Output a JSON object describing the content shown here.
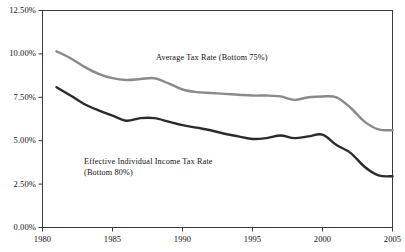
{
  "chart_data": {
    "type": "line",
    "title": "",
    "subtitle": "",
    "xlabel": "",
    "ylabel": "",
    "grid": false,
    "legend_position": "inline-annotation",
    "xlim": [
      1980,
      2005
    ],
    "ylim": [
      0.0,
      12.5
    ],
    "x_ticks": [
      "1980",
      "1985",
      "1990",
      "1995",
      "2000",
      "2005"
    ],
    "x_tick_values": [
      1980,
      1985,
      1990,
      1995,
      2000,
      2005
    ],
    "y_ticks": [
      "0.00%",
      "2.50%",
      "5.00%",
      "7.50%",
      "10.00%",
      "12.50%"
    ],
    "y_tick_values": [
      0.0,
      2.5,
      5.0,
      7.5,
      10.0,
      12.5
    ],
    "x": [
      1981,
      1982,
      1983,
      1984,
      1985,
      1986,
      1987,
      1988,
      1989,
      1990,
      1991,
      1992,
      1993,
      1994,
      1995,
      1996,
      1997,
      1998,
      1999,
      2000,
      2001,
      2002,
      2003,
      2004,
      2005
    ],
    "series": [
      {
        "name": "Average Tax Rate (Bottom 75%)",
        "color": "#8a8a8a",
        "values": [
          10.15,
          9.75,
          9.25,
          8.85,
          8.6,
          8.5,
          8.55,
          8.6,
          8.3,
          7.95,
          7.8,
          7.75,
          7.7,
          7.65,
          7.6,
          7.6,
          7.55,
          7.35,
          7.5,
          7.55,
          7.5,
          6.9,
          6.1,
          5.65,
          5.6
        ]
      },
      {
        "name": "Effective Individual Income Tax Rate (Bottom 80%)",
        "color": "#2b2b2b",
        "values": [
          8.08,
          7.6,
          7.1,
          6.75,
          6.45,
          6.15,
          6.3,
          6.3,
          6.1,
          5.9,
          5.75,
          5.6,
          5.4,
          5.25,
          5.1,
          5.15,
          5.3,
          5.15,
          5.25,
          5.35,
          4.75,
          4.3,
          3.5,
          3.0,
          2.95
        ]
      }
    ],
    "annotations": [
      {
        "name": "average-tax-rate-label",
        "lines": [
          "Average Tax Rate (Bottom 75%)"
        ],
        "x_px": 156,
        "y_px": 52
      },
      {
        "name": "effective-income-tax-rate-label",
        "lines": [
          "Effective Individual Income Tax Rate",
          "(Bottom 80%)"
        ],
        "x_px": 84,
        "y_px": 156
      }
    ]
  },
  "axes": {
    "frame_color": "#3a3a3a",
    "tick_color": "#3a3a3a"
  }
}
